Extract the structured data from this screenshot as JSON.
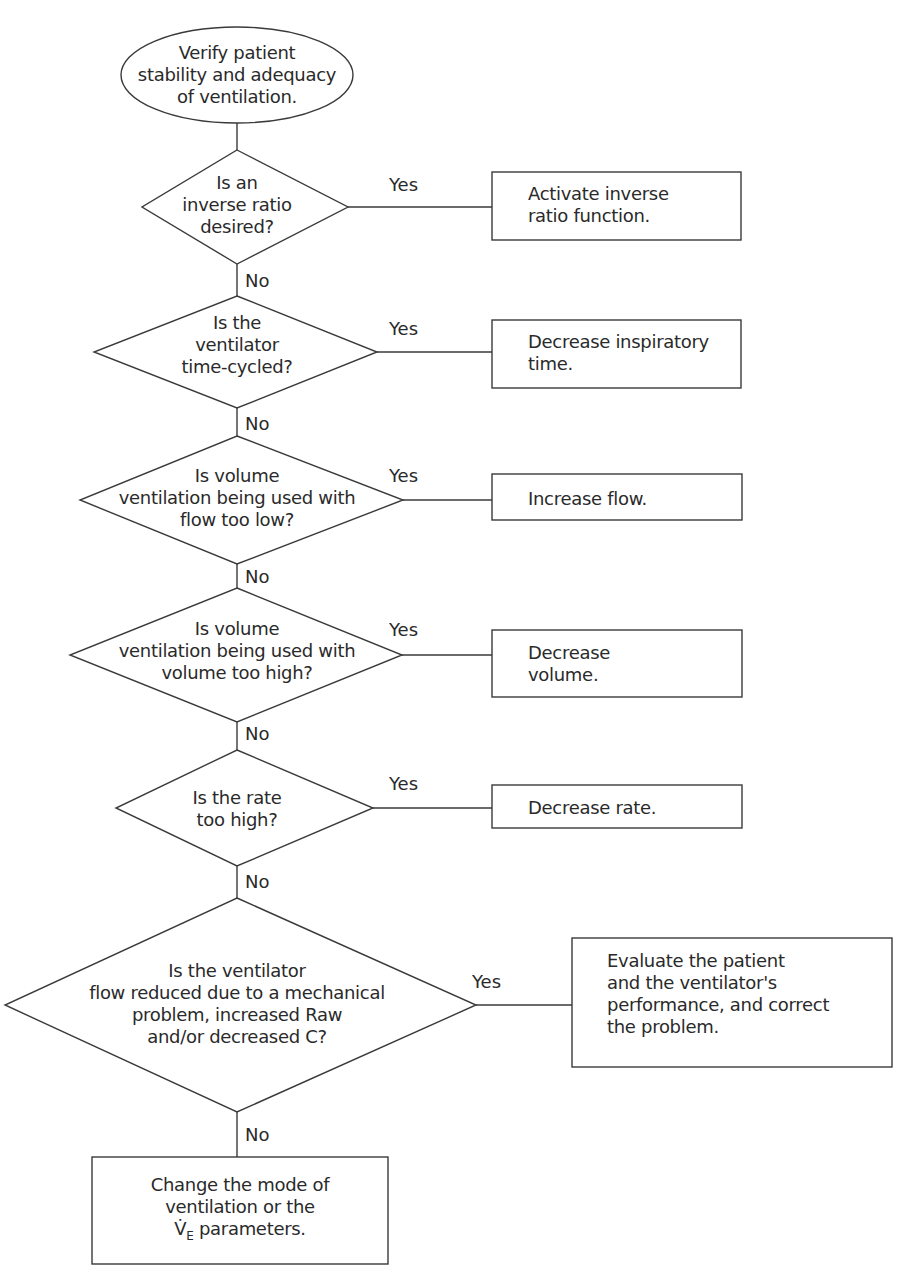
{
  "flowchart": {
    "start": {
      "lines": [
        "Verify patient",
        "stability and adequacy",
        "of ventilation."
      ]
    },
    "decisions": [
      {
        "lines": [
          "Is an",
          "inverse ratio",
          "desired?"
        ],
        "yes_label": "Yes",
        "no_label": "No",
        "action": {
          "lines": [
            "Activate inverse",
            "ratio function."
          ]
        }
      },
      {
        "lines": [
          "Is the",
          "ventilator",
          "time-cycled?"
        ],
        "yes_label": "Yes",
        "no_label": "No",
        "action": {
          "lines": [
            "Decrease inspiratory",
            "time."
          ]
        }
      },
      {
        "lines": [
          "Is volume",
          "ventilation being used with",
          "flow too low?"
        ],
        "yes_label": "Yes",
        "no_label": "No",
        "action": {
          "lines": [
            "Increase flow."
          ]
        }
      },
      {
        "lines": [
          "Is volume",
          "ventilation being used with",
          "volume too high?"
        ],
        "yes_label": "Yes",
        "no_label": "No",
        "action": {
          "lines": [
            "Decrease",
            "volume."
          ]
        }
      },
      {
        "lines": [
          "Is the rate",
          "too high?"
        ],
        "yes_label": "Yes",
        "no_label": "No",
        "action": {
          "lines": [
            "Decrease rate."
          ]
        }
      },
      {
        "lines": [
          "Is the ventilator",
          "flow reduced due to a mechanical",
          "problem, increased Raw",
          "and/or decreased C?"
        ],
        "yes_label": "Yes",
        "no_label": "No",
        "action": {
          "lines": [
            "Evaluate the patient",
            "and the ventilator's",
            "performance, and correct",
            "the problem."
          ]
        }
      }
    ],
    "end": {
      "lines": [
        "Change the mode of",
        "ventilation or the"
      ],
      "last_line_symbol": "V̇",
      "last_line_subscript": "E",
      "last_line_rest": " parameters."
    }
  },
  "colors": {
    "stroke": "#3a3a3a",
    "text": "#2a2a2a",
    "background": "#ffffff"
  }
}
